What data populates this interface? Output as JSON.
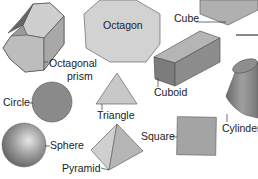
{
  "diagram": {
    "labels": {
      "octagon": "Octagon",
      "cube": "Cube",
      "octagonal_prism_1": "Octagonal",
      "octagonal_prism_2": "prism",
      "cuboid": "Cuboid",
      "circle": "Circle",
      "triangle": "Triangle",
      "cylinder": "Cylinder",
      "sphere": "Sphere",
      "square": "Square",
      "pyramid": "Pyramid"
    },
    "colors": {
      "shape_fill": "#b9b9b9",
      "shape_dark": "#6e6e6e",
      "outline": "#555555"
    }
  }
}
